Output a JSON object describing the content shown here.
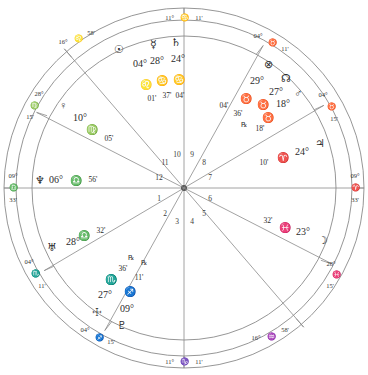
{
  "chart": {
    "type": "astrological-natal-wheel",
    "rings": {
      "outer_radius": 180,
      "zodiac_band_radius": 168,
      "inner_house_radius": 152
    },
    "axes": {
      "mc": {
        "label_deg": "11°",
        "sign": "♋",
        "label_min": "11'",
        "name": "Midheaven"
      },
      "ic": {
        "label_deg": "11°",
        "sign": "♑",
        "label_min": "11'",
        "name": "Imum Coeli"
      },
      "asc": {
        "label_deg": "09°",
        "sign": "♎",
        "label_min": "33'",
        "name": "Ascendant"
      },
      "dsc": {
        "label_deg": "09°",
        "sign": "♈",
        "label_min": "33'",
        "name": "Descendant"
      }
    },
    "house_numbers": [
      "1",
      "2",
      "3",
      "4",
      "5",
      "6",
      "7",
      "8",
      "9",
      "10",
      "11",
      "12"
    ],
    "cusps": [
      {
        "house": 11,
        "deg": "16°",
        "sign": "♌",
        "min": "58'"
      },
      {
        "house": 12,
        "deg": "28°",
        "sign": "♍",
        "min": "15'"
      },
      {
        "house": 2,
        "deg": "04°",
        "sign": "♏",
        "min": "11'"
      },
      {
        "house": 3,
        "deg": "04°",
        "sign": "♐",
        "min": "15'"
      },
      {
        "house": 5,
        "deg": "16°",
        "sign": "♒",
        "min": "58'"
      },
      {
        "house": 6,
        "deg": "28°",
        "sign": "♓",
        "min": "15'"
      },
      {
        "house": 8,
        "deg": "04°",
        "sign": "♉",
        "min": "15'"
      },
      {
        "house": 9,
        "deg": "04°",
        "sign": "♉",
        "min": "15'"
      },
      {
        "house": 9.5,
        "deg": "04°",
        "sign": "♉",
        "min": "11'"
      }
    ],
    "cusp_labels": [
      {
        "deg": "16°",
        "sign": "♌",
        "min": "58'"
      },
      {
        "deg": "28°",
        "sign": "♍",
        "min": "15'"
      },
      {
        "deg": "04°",
        "sign": "♏",
        "min": "11'"
      },
      {
        "deg": "04°",
        "sign": "♐",
        "min": "15'"
      },
      {
        "deg": "16°",
        "sign": "♒",
        "min": "58'"
      },
      {
        "deg": "28°",
        "sign": "♓",
        "min": "15'"
      },
      {
        "deg": "04°",
        "sign": "♉",
        "min": "15'"
      },
      {
        "deg": "04°",
        "sign": "♉",
        "min": "11'"
      }
    ],
    "planets": [
      {
        "name": "sun",
        "glyph": "☉",
        "deg": "04°",
        "sign": "♌",
        "min": "01'",
        "retro": ""
      },
      {
        "name": "mercury",
        "glyph": "☿",
        "deg": "28°",
        "sign": "♋",
        "min": "37'",
        "retro": ""
      },
      {
        "name": "saturn",
        "glyph": "♄",
        "deg": "24°",
        "sign": "♋",
        "min": "04'",
        "retro": ""
      },
      {
        "name": "part-of-fortune",
        "glyph": "⊗",
        "deg": "29°",
        "sign": "♉",
        "min": "36'",
        "retro": ""
      },
      {
        "name": "north-node",
        "glyph": "☊",
        "deg": "27°",
        "sign": "♉",
        "min": "04'",
        "retro": ""
      },
      {
        "name": "mars",
        "glyph": "♂",
        "deg": "18°",
        "sign": "♉",
        "min": "18'",
        "retro": "℞"
      },
      {
        "name": "jupiter",
        "glyph": "♃",
        "deg": "24°",
        "sign": "♈",
        "min": "10'",
        "retro": ""
      },
      {
        "name": "moon",
        "glyph": "☽",
        "deg": "23°",
        "sign": "♓",
        "min": "32'",
        "retro": ""
      },
      {
        "name": "pluto",
        "glyph": "♇",
        "deg": "09°",
        "sign": "♐",
        "min": "11'",
        "retro": "℞"
      },
      {
        "name": "south-node",
        "glyph": "☩",
        "deg": "27°",
        "sign": "♏",
        "min": "36'",
        "retro": "℞"
      },
      {
        "name": "uranus",
        "glyph": "♅",
        "deg": "28°",
        "sign": "♎",
        "min": "32'",
        "retro": ""
      },
      {
        "name": "neptune",
        "glyph": "♆",
        "deg": "06°",
        "sign": "♎",
        "min": "56'",
        "retro": ""
      },
      {
        "name": "venus",
        "glyph": "♀",
        "deg": "10°",
        "sign": "♍",
        "min": "05'",
        "retro": ""
      }
    ],
    "colors": {
      "line": "#7d7d7d",
      "ring": "#8a8a8a",
      "text": "#2b2b2b",
      "background": "#ffffff"
    }
  }
}
